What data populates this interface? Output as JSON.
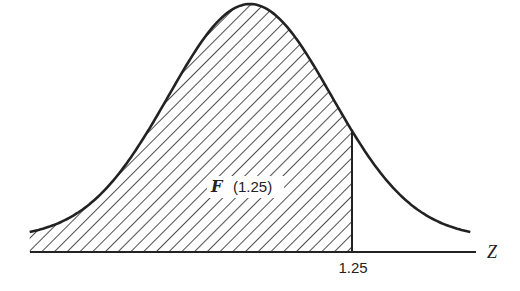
{
  "chart_data": {
    "type": "area",
    "title": "",
    "distribution": {
      "name": "standard normal",
      "mean": 0,
      "sd": 1
    },
    "xlim": [
      -2.7,
      2.75
    ],
    "shaded_region": {
      "from": -2.7,
      "to": 1.25,
      "pattern": "diagonal-hatch"
    },
    "xlabel": "Z",
    "tick_labels": [
      {
        "x": 1.25,
        "label": "1.25"
      }
    ],
    "annotation": {
      "func": "F",
      "arg": "(1.25)"
    },
    "grid": false,
    "line_color": "#222222"
  }
}
